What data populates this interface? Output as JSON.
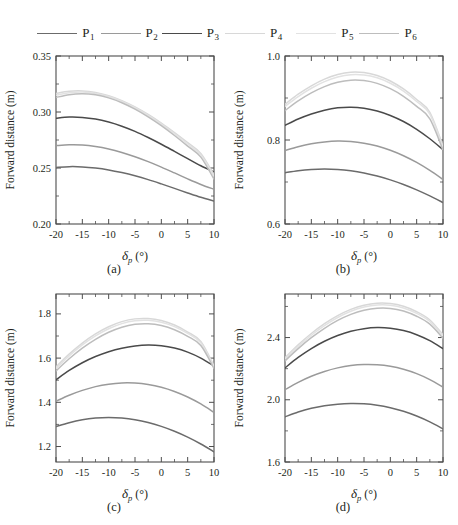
{
  "legend": {
    "entries": [
      {
        "label": "P",
        "sub": "1",
        "color": "#6b6b6b"
      },
      {
        "label": "P",
        "sub": "2",
        "color": "#9a9a9a"
      },
      {
        "label": "P",
        "sub": "3",
        "color": "#4a4a4a"
      },
      {
        "label": "P",
        "sub": "4",
        "color": "#d8d8d8"
      },
      {
        "label": "P",
        "sub": "5",
        "color": "#e2e2e2"
      },
      {
        "label": "P",
        "sub": "6",
        "color": "#bdbdbd"
      }
    ]
  },
  "axis": {
    "xlabel_symbol": "δ",
    "xlabel_sub": "p",
    "xlabel_unit": "(°)",
    "ylabel": "Forward distance (m)",
    "xticks": [
      -20,
      -15,
      -10,
      -5,
      0,
      5,
      10
    ],
    "xticklabels": [
      "-20",
      "-15",
      "-10",
      "-5",
      "0",
      "5",
      "10"
    ],
    "xlim": [
      -20,
      10
    ]
  },
  "chart_data": [
    {
      "id": "a",
      "type": "line",
      "caption": "(a)",
      "title": "",
      "xlabel": "δp (°)",
      "ylabel": "Forward distance (m)",
      "xlim": [
        -20,
        10
      ],
      "ylim": [
        0.2,
        0.35
      ],
      "yticks": [
        0.2,
        0.25,
        0.3,
        0.35
      ],
      "yticklabels": [
        "0.20",
        "0.25",
        "0.30",
        "0.35"
      ],
      "grid": false,
      "legend_position": "top-outside",
      "x": [
        -20,
        -17.5,
        -15,
        -12.5,
        -10,
        -7.5,
        -5,
        -2.5,
        0,
        2.5,
        5,
        7.5,
        10
      ],
      "series": [
        {
          "name": "P1",
          "color": "#6b6b6b",
          "values": [
            0.2505,
            0.2512,
            0.251,
            0.25,
            0.2483,
            0.2459,
            0.243,
            0.2396,
            0.2358,
            0.2318,
            0.2277,
            0.2238,
            0.2205
          ]
        },
        {
          "name": "P2",
          "color": "#9a9a9a",
          "values": [
            0.27,
            0.2707,
            0.2705,
            0.2692,
            0.267,
            0.2639,
            0.2601,
            0.2557,
            0.2508,
            0.2456,
            0.2403,
            0.2353,
            0.231
          ]
        },
        {
          "name": "P3",
          "color": "#4a4a4a",
          "values": [
            0.2945,
            0.2955,
            0.2952,
            0.2937,
            0.291,
            0.2873,
            0.2827,
            0.2772,
            0.2712,
            0.2648,
            0.2583,
            0.252,
            0.2465
          ]
        },
        {
          "name": "P4",
          "color": "#d8d8d8",
          "values": [
            0.3165,
            0.3185,
            0.3188,
            0.3175,
            0.3146,
            0.3102,
            0.3046,
            0.2978,
            0.2901,
            0.2816,
            0.2726,
            0.263,
            0.244
          ]
        },
        {
          "name": "P5",
          "color": "#e2e2e2",
          "values": [
            0.315,
            0.3172,
            0.3178,
            0.3166,
            0.3138,
            0.3095,
            0.3038,
            0.297,
            0.2892,
            0.2806,
            0.2714,
            0.2617,
            0.2425
          ]
        },
        {
          "name": "P6",
          "color": "#bdbdbd",
          "values": [
            0.313,
            0.3155,
            0.3163,
            0.3153,
            0.3126,
            0.3083,
            0.3026,
            0.2957,
            0.2878,
            0.279,
            0.2696,
            0.2597,
            0.24
          ]
        }
      ]
    },
    {
      "id": "b",
      "type": "line",
      "caption": "(b)",
      "title": "",
      "xlabel": "δp (°)",
      "ylabel": "Forward distance (m)",
      "xlim": [
        -20,
        10
      ],
      "ylim": [
        0.6,
        1.0
      ],
      "yticks": [
        0.6,
        0.8,
        1.0
      ],
      "yticklabels": [
        "0.6",
        "0.8",
        "1.0"
      ],
      "grid": false,
      "legend_position": "top-outside",
      "x": [
        -20,
        -17.5,
        -15,
        -12.5,
        -10,
        -7.5,
        -5,
        -2.5,
        0,
        2.5,
        5,
        7.5,
        10
      ],
      "series": [
        {
          "name": "P1",
          "color": "#6b6b6b",
          "values": [
            0.722,
            0.727,
            0.73,
            0.731,
            0.73,
            0.7268,
            0.7215,
            0.7142,
            0.705,
            0.694,
            0.6812,
            0.6668,
            0.651
          ]
        },
        {
          "name": "P2",
          "color": "#9a9a9a",
          "values": [
            0.775,
            0.784,
            0.791,
            0.7955,
            0.7975,
            0.7965,
            0.7925,
            0.7855,
            0.7755,
            0.7625,
            0.7465,
            0.7275,
            0.706
          ]
        },
        {
          "name": "P3",
          "color": "#4a4a4a",
          "values": [
            0.835,
            0.85,
            0.862,
            0.871,
            0.8765,
            0.878,
            0.8755,
            0.869,
            0.8585,
            0.844,
            0.8255,
            0.803,
            0.777
          ]
        },
        {
          "name": "P4",
          "color": "#d8d8d8",
          "values": [
            0.885,
            0.909,
            0.929,
            0.945,
            0.956,
            0.9615,
            0.9605,
            0.9535,
            0.9405,
            0.9215,
            0.8965,
            0.866,
            0.786
          ]
        },
        {
          "name": "P5",
          "color": "#e2e2e2",
          "values": [
            0.88,
            0.9035,
            0.9232,
            0.939,
            0.95,
            0.9555,
            0.9548,
            0.948,
            0.9352,
            0.9165,
            0.8918,
            0.8615,
            0.782
          ]
        },
        {
          "name": "P6",
          "color": "#bdbdbd",
          "values": [
            0.87,
            0.893,
            0.912,
            0.927,
            0.9375,
            0.9425,
            0.9415,
            0.9348,
            0.9222,
            0.904,
            0.88,
            0.8505,
            0.776
          ]
        }
      ]
    },
    {
      "id": "c",
      "type": "line",
      "caption": "(c)",
      "title": "",
      "xlabel": "δp (°)",
      "ylabel": "Forward distance (m)",
      "xlim": [
        -20,
        10
      ],
      "ylim": [
        1.13,
        1.89
      ],
      "yticks": [
        1.2,
        1.4,
        1.6,
        1.8
      ],
      "yticklabels": [
        "1.2",
        "1.4",
        "1.6",
        "1.8"
      ],
      "grid": false,
      "legend_position": "top-outside",
      "x": [
        -20,
        -17.5,
        -15,
        -12.5,
        -10,
        -7.5,
        -5,
        -2.5,
        0,
        2.5,
        5,
        7.5,
        10
      ],
      "series": [
        {
          "name": "P1",
          "color": "#6b6b6b",
          "values": [
            1.29,
            1.308,
            1.321,
            1.3285,
            1.331,
            1.3285,
            1.321,
            1.3085,
            1.291,
            1.269,
            1.2425,
            1.2115,
            1.176
          ]
        },
        {
          "name": "P2",
          "color": "#9a9a9a",
          "values": [
            1.405,
            1.432,
            1.454,
            1.471,
            1.482,
            1.4875,
            1.487,
            1.4805,
            1.468,
            1.449,
            1.424,
            1.3925,
            1.3545
          ]
        },
        {
          "name": "P3",
          "color": "#4a4a4a",
          "values": [
            1.502,
            1.544,
            1.579,
            1.607,
            1.629,
            1.645,
            1.655,
            1.659,
            1.656,
            1.6455,
            1.627,
            1.6,
            1.564
          ]
        },
        {
          "name": "P4",
          "color": "#d8d8d8",
          "values": [
            1.56,
            1.618,
            1.668,
            1.7095,
            1.742,
            1.765,
            1.7775,
            1.779,
            1.77,
            1.7495,
            1.718,
            1.675,
            1.565
          ]
        },
        {
          "name": "P5",
          "color": "#e2e2e2",
          "values": [
            1.553,
            1.61,
            1.6595,
            1.7005,
            1.733,
            1.756,
            1.769,
            1.771,
            1.7625,
            1.7425,
            1.7115,
            1.669,
            1.56
          ]
        },
        {
          "name": "P6",
          "color": "#bdbdbd",
          "values": [
            1.542,
            1.597,
            1.645,
            1.685,
            1.717,
            1.74,
            1.753,
            1.7555,
            1.7475,
            1.7285,
            1.6985,
            1.657,
            1.553
          ]
        }
      ]
    },
    {
      "id": "d",
      "type": "line",
      "caption": "(d)",
      "title": "",
      "xlabel": "δp (°)",
      "ylabel": "Forward distance (m)",
      "xlim": [
        -20,
        10
      ],
      "ylim": [
        1.6,
        2.68
      ],
      "yticks": [
        1.6,
        2.0,
        2.4
      ],
      "yticklabels": [
        "1.6",
        "2.0",
        "2.4"
      ],
      "grid": false,
      "legend_position": "top-outside",
      "x": [
        -20,
        -17.5,
        -15,
        -12.5,
        -10,
        -7.5,
        -5,
        -2.5,
        0,
        2.5,
        5,
        7.5,
        10
      ],
      "series": [
        {
          "name": "P1",
          "color": "#6b6b6b",
          "values": [
            1.89,
            1.921,
            1.945,
            1.962,
            1.972,
            1.976,
            1.974,
            1.965,
            1.949,
            1.926,
            1.8955,
            1.858,
            1.813
          ]
        },
        {
          "name": "P2",
          "color": "#9a9a9a",
          "values": [
            2.065,
            2.112,
            2.151,
            2.182,
            2.205,
            2.22,
            2.2265,
            2.225,
            2.215,
            2.196,
            2.168,
            2.13,
            2.082
          ]
        },
        {
          "name": "P3",
          "color": "#4a4a4a",
          "values": [
            2.205,
            2.272,
            2.329,
            2.376,
            2.413,
            2.44,
            2.457,
            2.464,
            2.46,
            2.445,
            2.4185,
            2.38,
            2.329
          ]
        },
        {
          "name": "P4",
          "color": "#d8d8d8",
          "values": [
            2.27,
            2.353,
            2.426,
            2.489,
            2.541,
            2.581,
            2.608,
            2.621,
            2.619,
            2.601,
            2.566,
            2.513,
            2.419
          ]
        },
        {
          "name": "P5",
          "color": "#e2e2e2",
          "values": [
            2.262,
            2.343,
            2.415,
            2.477,
            2.529,
            2.569,
            2.596,
            2.609,
            2.6075,
            2.59,
            2.5555,
            2.503,
            2.411
          ]
        },
        {
          "name": "P6",
          "color": "#bdbdbd",
          "values": [
            2.25,
            2.329,
            2.399,
            2.4595,
            2.51,
            2.549,
            2.5755,
            2.5885,
            2.5875,
            2.5705,
            2.537,
            2.486,
            2.396
          ]
        }
      ]
    }
  ]
}
